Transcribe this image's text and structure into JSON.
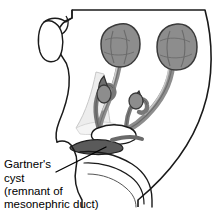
{
  "figure": {
    "name": "female-reproductive-tract-gartners-cyst-illustration",
    "title": "Gartner's cyst (remnant of mesonephric duct)",
    "background_color": "#ffffff",
    "outline_color": "#1a1a1a",
    "colors": {
      "organ_gray": "#8d8d8d",
      "organ_gray_dark": "#6e6e6e",
      "duct_gray": "#787878",
      "cyst_dark": "#5a5a5a",
      "ligament_light": "#ededed",
      "shadow_light": "#d9d9d9",
      "outline": "#1a1a1a",
      "text": "#000000"
    }
  },
  "caption": {
    "name": "gartners-cyst-label",
    "lines": [
      "Gartner's",
      "cyst",
      "(remnant of",
      "mesonephric duct)"
    ],
    "line_1": "Gartner's",
    "line_2": "cyst",
    "line_3": "(remnant of",
    "line_4": "mesonephric duct)",
    "font_size_px": 11.5
  },
  "leader_line": {
    "name": "gartners-cyst-leader-line",
    "from_x": 56,
    "from_y": 172,
    "to_x": 106,
    "to_y": 147
  },
  "structures": [
    {
      "name": "body-outline",
      "label": "pelvic body wall outline"
    },
    {
      "name": "cut-stump",
      "label": "cut cylindrical stump (upper left)"
    },
    {
      "name": "ovary-left",
      "label": "left ovary",
      "cx": 120,
      "cy": 45,
      "rx": 19,
      "ry": 21,
      "fill": "#8d8d8d"
    },
    {
      "name": "ovary-right",
      "label": "right ovary",
      "cx": 177,
      "cy": 47,
      "rx": 20,
      "ry": 22,
      "fill": "#8d8d8d"
    },
    {
      "name": "fallopian-tube-left",
      "label": "left uterine (fallopian) tube"
    },
    {
      "name": "fallopian-tube-right",
      "label": "right uterine (fallopian) tube"
    },
    {
      "name": "epoophoron-left",
      "label": "left epoophoron remnant bulb",
      "cx": 104,
      "cy": 94,
      "rx": 7,
      "ry": 9,
      "fill": "#8d8d8d"
    },
    {
      "name": "epoophoron-right",
      "label": "right epoophoron remnant bulb",
      "cx": 136,
      "cy": 101,
      "rx": 7,
      "ry": 8,
      "fill": "#8d8d8d"
    },
    {
      "name": "broad-ligament",
      "label": "broad ligament (light shaded sheet)",
      "fill": "#ededed"
    },
    {
      "name": "uterus",
      "label": "uterus"
    },
    {
      "name": "gartners-cyst",
      "label": "Gartner's cyst (dark elongated remnant of mesonephric duct)",
      "fill": "#5a5a5a"
    },
    {
      "name": "vagina",
      "label": "vagina"
    }
  ]
}
